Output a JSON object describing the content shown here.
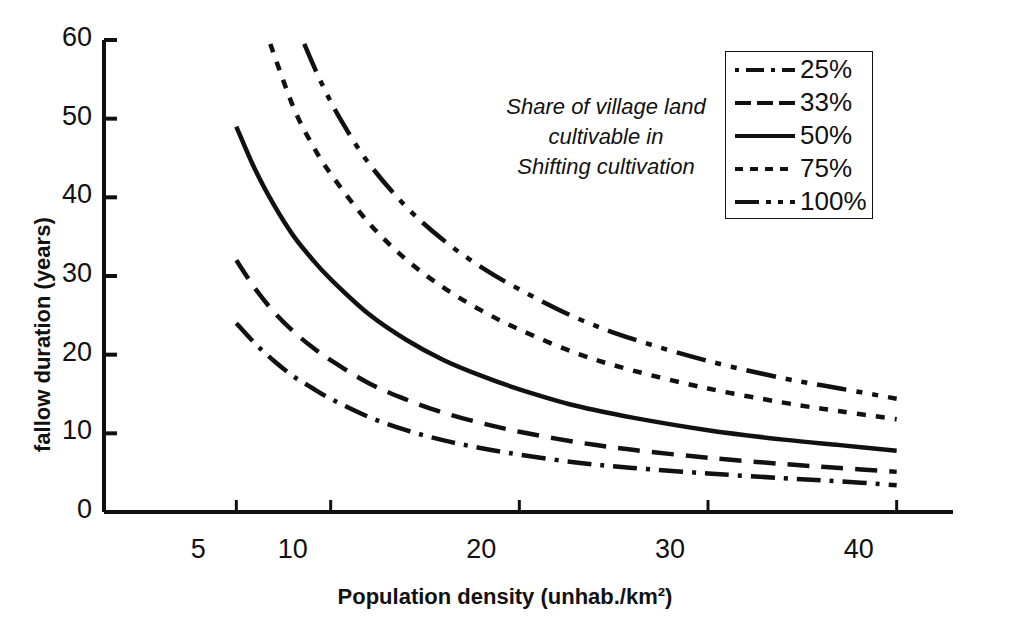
{
  "chart_data": {
    "type": "line",
    "title": "",
    "xlabel": "Population density (unhab./km²)",
    "ylabel": "fallow duration (years)",
    "xlim": [
      0,
      45
    ],
    "ylim": [
      0,
      60
    ],
    "xticks": [
      5,
      10,
      20,
      30,
      40
    ],
    "xtick_labels": [
      "5",
      "10",
      "20",
      "30",
      "40"
    ],
    "yticks": [
      0,
      10,
      20,
      30,
      40,
      50,
      60
    ],
    "ytick_labels": [
      "0",
      "10",
      "20",
      "30",
      "40",
      "50",
      "60"
    ],
    "grid": false,
    "legend_position": "upper-right",
    "legend_title": "Share of village land cultivable in Shifting cultivation",
    "annotation": {
      "line1": "Share of village land",
      "line2": "cultivable in",
      "line3": "Shifting cultivation"
    },
    "series": [
      {
        "name": "25%",
        "label": "25%",
        "style": "dash-dot",
        "color": "#111111",
        "x": [
          5.0,
          6.0,
          7.0,
          8.0,
          9.0,
          10.0,
          12.0,
          14.0,
          16.0,
          18.0,
          20.0,
          23.0,
          26.0,
          30.0,
          34.0,
          37.0,
          40.0
        ],
        "y": [
          24.0,
          21.4,
          19.2,
          17.3,
          15.8,
          14.4,
          12.1,
          10.4,
          9.1,
          8.1,
          7.3,
          6.3,
          5.6,
          4.9,
          4.3,
          3.9,
          3.4
        ]
      },
      {
        "name": "33%",
        "label": "33%",
        "style": "long-dash",
        "color": "#111111",
        "x": [
          5.0,
          6.0,
          7.0,
          8.0,
          9.0,
          10.0,
          12.0,
          14.0,
          16.0,
          18.0,
          20.0,
          23.0,
          26.0,
          30.0,
          34.0,
          37.0,
          40.0
        ],
        "y": [
          32.0,
          28.4,
          25.4,
          23.0,
          21.0,
          19.3,
          16.4,
          14.3,
          12.6,
          11.3,
          10.2,
          8.9,
          7.9,
          6.9,
          6.1,
          5.6,
          5.1
        ]
      },
      {
        "name": "50%",
        "label": "50%",
        "style": "solid",
        "color": "#111111",
        "x": [
          5.0,
          6.0,
          7.0,
          8.0,
          9.0,
          10.0,
          12.0,
          14.0,
          16.0,
          18.0,
          20.0,
          23.0,
          26.0,
          30.0,
          34.0,
          37.0,
          40.0
        ],
        "y": [
          49.0,
          43.5,
          39.0,
          35.2,
          32.2,
          29.6,
          25.2,
          21.9,
          19.3,
          17.3,
          15.6,
          13.5,
          12.0,
          10.4,
          9.2,
          8.5,
          7.8
        ]
      },
      {
        "name": "75%",
        "label": "75%",
        "style": "fine-dash",
        "color": "#111111",
        "x": [
          6.8,
          8.0,
          9.0,
          10.0,
          12.0,
          14.0,
          16.0,
          18.0,
          20.0,
          23.0,
          26.0,
          30.0,
          34.0,
          37.0,
          40.0
        ],
        "y": [
          59.5,
          51.6,
          46.8,
          43.0,
          36.8,
          32.1,
          28.5,
          25.6,
          23.2,
          20.2,
          18.0,
          15.7,
          13.9,
          12.8,
          11.8
        ]
      },
      {
        "name": "100%",
        "label": "100%",
        "style": "dash-dot-long",
        "color": "#111111",
        "x": [
          8.6,
          9.5,
          10.5,
          12.0,
          14.0,
          16.0,
          18.0,
          20.0,
          23.0,
          26.0,
          30.0,
          34.0,
          37.0,
          40.0
        ],
        "y": [
          59.5,
          54.6,
          50.0,
          44.4,
          38.8,
          34.5,
          31.1,
          28.3,
          24.7,
          22.0,
          19.2,
          17.0,
          15.7,
          14.4
        ]
      }
    ]
  }
}
